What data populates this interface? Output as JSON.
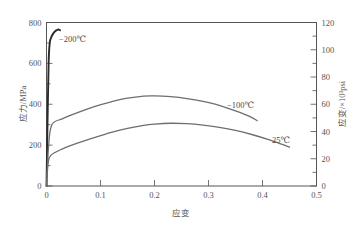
{
  "chart_data": {
    "type": "line",
    "title": "",
    "xlabel": "应变",
    "ylabel": "应力/MPa",
    "y2label": "应变/×10³psi",
    "xlim": [
      0,
      0.5
    ],
    "ylim": [
      0,
      800
    ],
    "y2lim": [
      0,
      120
    ],
    "grid": false,
    "legend_position": "inline-annotations",
    "x_ticks": [
      "0",
      "0.1",
      "0.2",
      "0.3",
      "0.4",
      "0.5"
    ],
    "x_tick_values": [
      0,
      0.1,
      0.2,
      0.3,
      0.4,
      0.5
    ],
    "y_ticks": [
      "0",
      "200",
      "400",
      "600",
      "800"
    ],
    "y_tick_values": [
      0,
      200,
      400,
      600,
      800
    ],
    "y2_ticks": [
      "0",
      "20",
      "40",
      "60",
      "80",
      "100",
      "120"
    ],
    "y2_tick_values": [
      0,
      20,
      40,
      60,
      80,
      100,
      120
    ],
    "y_minor_tick_values": [
      100,
      300,
      500,
      700
    ],
    "y2_minor_tick_values": [
      10,
      30,
      50,
      70,
      90,
      110
    ],
    "series": [
      {
        "name": "-200℃",
        "label": "−200℃",
        "color": "#2b2b2b",
        "width": 1.9,
        "x": [
          0,
          0.002,
          0.004,
          0.006,
          0.008,
          0.01,
          0.013,
          0.016,
          0.019,
          0.022,
          0.025
        ],
        "values": [
          0,
          330,
          610,
          700,
          722,
          735,
          748,
          757,
          763,
          766,
          762
        ]
      },
      {
        "name": "-100℃",
        "label": "−100℃",
        "color": "#6e6e6e",
        "width": 1.3,
        "x": [
          0,
          0.004,
          0.01,
          0.03,
          0.06,
          0.09,
          0.12,
          0.15,
          0.18,
          0.2,
          0.23,
          0.26,
          0.29,
          0.32,
          0.35,
          0.375,
          0.39
        ],
        "values": [
          0,
          200,
          300,
          330,
          362,
          390,
          412,
          430,
          440,
          441,
          437,
          428,
          414,
          395,
          368,
          342,
          320
        ]
      },
      {
        "name": "25℃",
        "label": "25℃",
        "color": "#6e6e6e",
        "width": 1.3,
        "x": [
          0,
          0.003,
          0.008,
          0.03,
          0.06,
          0.09,
          0.12,
          0.15,
          0.18,
          0.2,
          0.23,
          0.26,
          0.29,
          0.32,
          0.35,
          0.38,
          0.41,
          0.435,
          0.45
        ],
        "values": [
          0,
          110,
          150,
          182,
          212,
          238,
          262,
          282,
          297,
          303,
          307,
          305,
          298,
          287,
          272,
          252,
          228,
          205,
          190
        ]
      }
    ],
    "annotations": [
      {
        "text": "−200℃",
        "x_px": 59,
        "y_px": 42,
        "name": "series-label-minus200"
      },
      {
        "text": "−100℃",
        "x_px": 227,
        "y_px": 108,
        "name": "series-label-minus100"
      },
      {
        "text": "25℃",
        "x_px": 272,
        "y_px": 143,
        "name": "series-label-25"
      }
    ]
  },
  "axes": {
    "left_title": "应力/MPa",
    "right_title": "应变/×10³psi",
    "bottom_title": "应变"
  },
  "colors": {
    "frame": "#555555",
    "text": "#555555",
    "curve_dark": "#2b2b2b",
    "curve_gray": "#6e6e6e",
    "background": "#ffffff"
  }
}
